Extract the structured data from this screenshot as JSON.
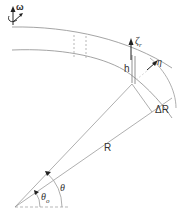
{
  "figure": {
    "labels": {
      "omega": "ω",
      "h": "h",
      "zeta": "ζ",
      "zeta_sub": "r",
      "eta": "η",
      "delta_r": "ΔR",
      "r": "R",
      "theta": "θ",
      "theta0": "θ",
      "theta0_sub": "o"
    },
    "colors": {
      "line": "#9a9a9a",
      "dark": "#222222",
      "text": "#333333"
    }
  }
}
